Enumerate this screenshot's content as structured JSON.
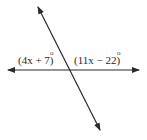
{
  "diagram": {
    "type": "intersecting-lines",
    "stroke_color": "#2a2a2a",
    "background": "#ffffff",
    "horizontal_line": {
      "x1": 8,
      "y1": 70,
      "x2": 139,
      "y2": 70,
      "arrows": "both"
    },
    "transversal": {
      "x1": 38,
      "y1": 7,
      "x2": 100,
      "y2": 130,
      "arrows": "both"
    },
    "labels": [
      {
        "id": "left_angle",
        "text": "(4x + 7)",
        "degree": "o",
        "x": 18,
        "y": 64
      },
      {
        "id": "right_angle",
        "text": "(11x − 22)",
        "degree": "o",
        "x": 74,
        "y": 64
      }
    ]
  }
}
